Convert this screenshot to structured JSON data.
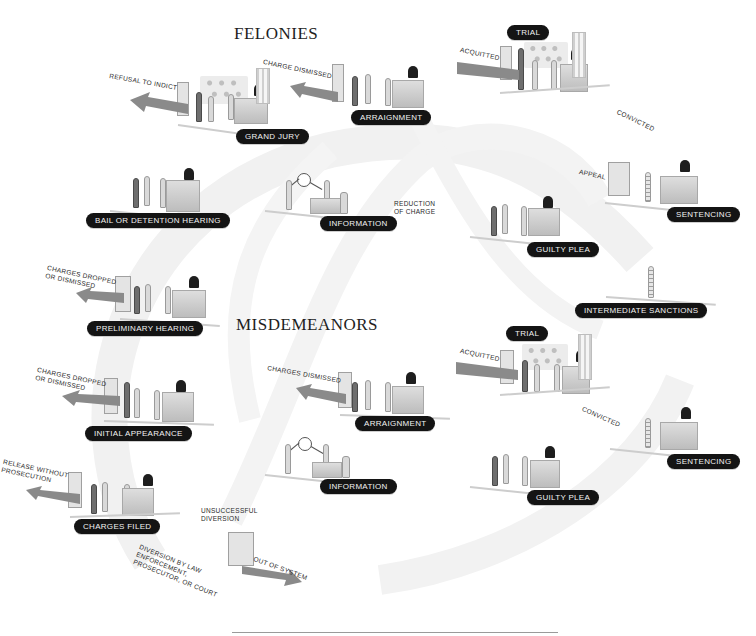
{
  "diagram": {
    "type": "criminal justice process flow",
    "sections": {
      "felonies": {
        "title": "FELONIES"
      },
      "misdemeanors": {
        "title": "MISDEMEANORS"
      }
    },
    "stages": {
      "grand_jury": "GRAND JURY",
      "arraignment_felony": "ARRAIGNMENT",
      "trial_felony": "TRIAL",
      "bail_hearing": "BAIL OR DETENTION HEARING",
      "information_felony": "INFORMATION",
      "sentencing_felony": "SENTENCING",
      "guilty_plea_felony": "GUILTY PLEA",
      "intermediate_sanctions": "INTERMEDIATE SANCTIONS",
      "preliminary_hearing": "PRELIMINARY HEARING",
      "initial_appearance": "INITIAL APPEARANCE",
      "arraignment_misd": "ARRAIGNMENT",
      "information_misd": "INFORMATION",
      "trial_misd": "TRIAL",
      "sentencing_misd": "SENTENCING",
      "guilty_plea_misd": "GUILTY PLEA",
      "charges_filed": "CHARGES FILED"
    },
    "exits": {
      "refusal_to_indict": "REFUSAL TO INDICT",
      "charge_dismissed": "CHARGE DISMISSED",
      "acquitted_felony": "ACQUITTED",
      "convicted_felony": "CONVICTED",
      "appeal": "APPEAL",
      "reduction_of_charge": "REDUCTION\nOF CHARGE",
      "charges_dropped_prelim": "CHARGES DROPPED\nOR DISMISSED",
      "charges_dropped_initial": "CHARGES DROPPED\nOR DISMISSED",
      "charges_dismissed_misd": "CHARGES DISMISSED",
      "acquitted_misd": "ACQUITTED",
      "convicted_misd": "CONVICTED",
      "release_without_prosecution": "RELEASE WITHOUT\nPROSECUTION",
      "unsuccessful_diversion": "UNSUCCESSFUL\nDIVERSION",
      "diversion": "DIVERSION BY LAW\nENFORCEMENT,\nPROSECUTOR, OR COURT",
      "out_of_system": "OUT OF SYSTEM"
    },
    "colors": {
      "label_bg": "#141414",
      "label_text": "#f2f2f2",
      "arrow": "#8a8a8a",
      "background_arc": "#f0f0f0"
    }
  }
}
